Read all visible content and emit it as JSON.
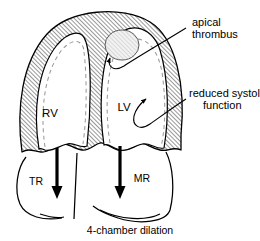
{
  "figure": {
    "title": "4-chamber dilation",
    "caption": "4-chamber dilation",
    "colors": {
      "ink": "#000000",
      "background": "#ffffff",
      "myocardium_hatch": "#3a3a3a",
      "endocardium_dashed": "#9a9a9a",
      "thrombus_fill": "#e8e8e8"
    },
    "chambers": [
      {
        "id": "rv",
        "label": "RV",
        "name": "right ventricle"
      },
      {
        "id": "lv",
        "label": "LV",
        "name": "left ventricle"
      }
    ],
    "flow_arrows": [
      {
        "id": "tr",
        "label": "TR",
        "name": "tricuspid regurgitation",
        "direction": "down"
      },
      {
        "id": "mr",
        "label": "MR",
        "name": "mitral regurgitation",
        "direction": "down"
      }
    ],
    "callouts": [
      {
        "id": "apical-thrombus",
        "line1": "apical",
        "line2": "thrombus",
        "target": "left ventricular apex"
      },
      {
        "id": "reduced-systolic-function",
        "line1": "reduced systolic",
        "line2": "function",
        "target": "left ventricular wall"
      }
    ]
  }
}
